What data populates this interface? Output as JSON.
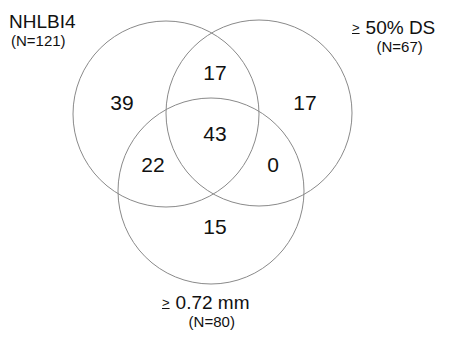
{
  "sets": {
    "left": {
      "name": "NHLBI4",
      "n_label": "(N=121)",
      "prefix": ""
    },
    "right": {
      "name": "50% DS",
      "n_label": "(N=67)",
      "prefix": ">"
    },
    "bottom": {
      "name": "0.72 mm",
      "n_label": "(N=80)",
      "prefix": ">"
    }
  },
  "regions": {
    "left_only": "39",
    "right_only": "17",
    "bottom_only": "15",
    "left_right": "17",
    "left_bottom": "22",
    "right_bottom": "0",
    "all_three": "43"
  },
  "colors": {
    "stroke": "#8a8a8a",
    "text": "#111111",
    "background": "#ffffff"
  }
}
